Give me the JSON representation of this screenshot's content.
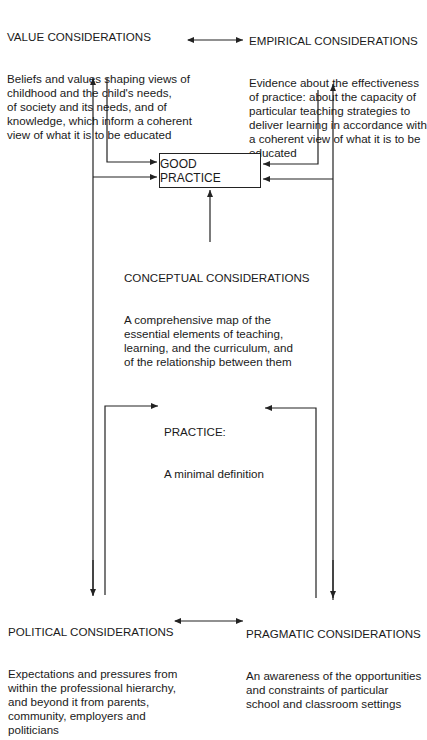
{
  "value": {
    "title": "VALUE CONSIDERATIONS",
    "body": "Beliefs and values shaping views of\nchildhood and the child's needs,\nof society and its needs, and of\nknowledge, which inform a coherent\nview of what it is to be educated"
  },
  "empirical": {
    "title": "EMPIRICAL CONSIDERATIONS",
    "body": "Evidence about the effectiveness\nof practice: about the capacity of\nparticular teaching strategies to\ndeliver learning in accordance with\na coherent view of what it is to be\neducated"
  },
  "good_practice": {
    "label": "GOOD PRACTICE"
  },
  "conceptual": {
    "title": "CONCEPTUAL CONSIDERATIONS",
    "body": "A comprehensive map of the\nessential elements of teaching,\nlearning, and the curriculum, and\nof the relationship between them"
  },
  "practice": {
    "title": "PRACTICE:",
    "body": "A minimal definition"
  },
  "political": {
    "title": "POLITICAL CONSIDERATIONS",
    "body": "Expectations and pressures from\nwithin the professional hierarchy,\nand beyond it from parents,\ncommunity, employers and\npoliticians"
  },
  "pragmatic": {
    "title": "PRAGMATIC CONSIDERATIONS",
    "body": "An awareness of the opportunities\nand constraints of particular\nschool and classroom settings"
  },
  "colors": {
    "line": "#222222",
    "text": "#1a1a1a",
    "background": "#ffffff"
  }
}
